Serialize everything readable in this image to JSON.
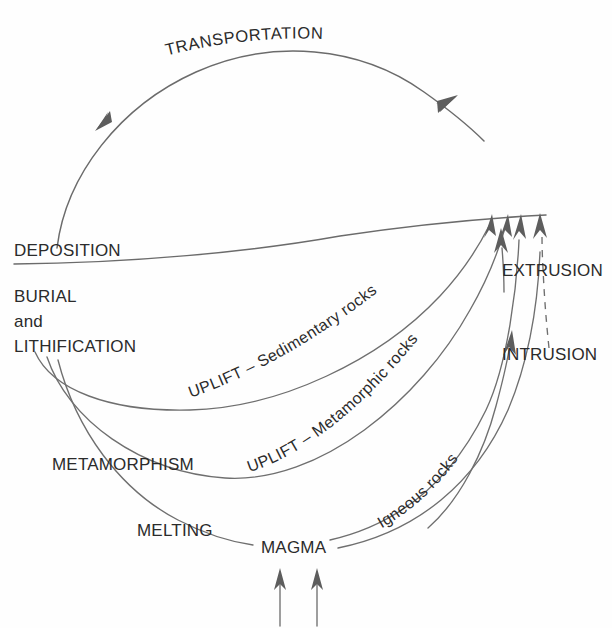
{
  "diagram": {
    "background_color": "#fefefe",
    "line_color": "#6b6b6b",
    "text_color": "#2b2b2b",
    "labels": {
      "transportation": "TRANSPORTATION",
      "deposition": "DEPOSITION",
      "burial": "BURIAL",
      "and": "and",
      "lithification": "LITHIFICATION",
      "metamorphism": "METAMORPHISM",
      "melting": "MELTING",
      "magma": "MAGMA",
      "extrusion": "EXTRUSION",
      "intrusion": "INTRUSION",
      "uplift_sedimentary": "UPLIFT – Sedimentary rocks",
      "uplift_metamorphic": "UPLIFT – Metamorphic rocks",
      "igneous_rocks": "Igneous rocks"
    },
    "processes": [
      "TRANSPORTATION",
      "DEPOSITION",
      "BURIAL and LITHIFICATION",
      "METAMORPHISM",
      "MELTING",
      "EXTRUSION",
      "INTRUSION",
      "UPLIFT – Sedimentary rocks",
      "UPLIFT – Metamorphic rocks"
    ],
    "materials": [
      "MAGMA",
      "Igneous rocks",
      "Sedimentary rocks",
      "Metamorphic rocks"
    ],
    "arrow_count": {
      "converging_at_deposition_line": 4,
      "heat_arrows_below_magma": 2,
      "transportation_arc_arrowheads": 2
    }
  }
}
